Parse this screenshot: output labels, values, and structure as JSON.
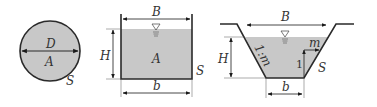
{
  "colors": {
    "fill": "#c8c8c8",
    "stroke": "#2a2a2a",
    "background": "#ffffff"
  },
  "circle_section": {
    "diameter_label": "D",
    "area_label": "A",
    "perimeter_label": "S"
  },
  "rectangular_section": {
    "top_width_label": "B",
    "depth_label": "H",
    "area_label": "A",
    "perimeter_label": "S",
    "bottom_width_label": "b",
    "water_surface_symbol": "▽"
  },
  "trapezoidal_section": {
    "top_width_label": "B",
    "depth_label": "H",
    "slope_label": "1:m",
    "slope_horizontal_label": "m",
    "slope_vertical_label": "1",
    "perimeter_label": "S",
    "bottom_width_label": "b",
    "water_surface_symbol": "▽"
  }
}
